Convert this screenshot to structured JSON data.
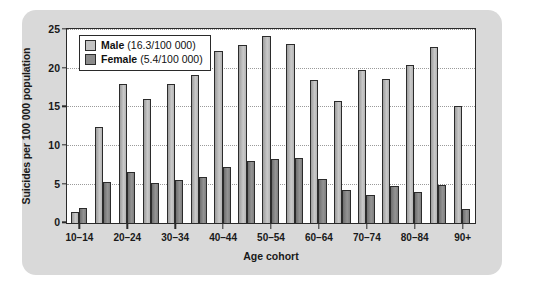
{
  "chart_data": {
    "type": "bar",
    "title": "",
    "xlabel": "Age cohort",
    "ylabel": "Suicides per 100 000 population",
    "ylim": [
      0,
      25
    ],
    "yticks": [
      0,
      5,
      10,
      15,
      20,
      25
    ],
    "grid": true,
    "legend_position": "top-left",
    "categories": [
      "10–14",
      "15–19",
      "20–24",
      "25–29",
      "30–34",
      "35–39",
      "40–44",
      "45–49",
      "50–54",
      "55–59",
      "60–64",
      "65–69",
      "70–74",
      "75–79",
      "80–84",
      "85–89",
      "90+"
    ],
    "tick_labels": [
      "10–14",
      "",
      "20–24",
      "",
      "30–34",
      "",
      "40–44",
      "",
      "50–54",
      "",
      "60–64",
      "",
      "70–74",
      "",
      "80–84",
      "",
      "90+"
    ],
    "series": [
      {
        "name": "Male",
        "rate_label": "(16.3/100 000)",
        "color": "#c2c2c2",
        "values": [
          1.4,
          12.4,
          18.0,
          16.0,
          18.0,
          19.1,
          22.2,
          23.0,
          24.2,
          23.1,
          18.5,
          15.8,
          19.8,
          18.7,
          20.5,
          22.8,
          15.1
        ]
      },
      {
        "name": "Female",
        "rate_label": "(5.4/100 000)",
        "color": "#8b8b8b",
        "values": [
          1.9,
          5.3,
          6.6,
          5.2,
          5.6,
          6.0,
          7.2,
          8.0,
          8.3,
          8.4,
          5.7,
          4.3,
          3.6,
          4.8,
          4.0,
          4.9,
          1.8
        ]
      }
    ]
  }
}
